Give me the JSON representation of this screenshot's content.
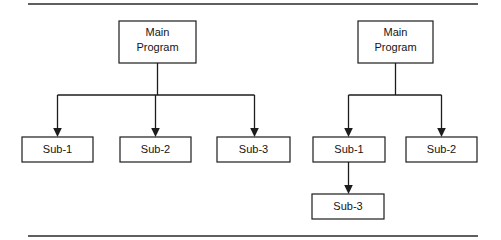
{
  "page": {
    "background_color": "#ffffff",
    "line_color": "#1c1c1c",
    "text_color": "#141414",
    "width": 501,
    "height": 240
  },
  "rules": [
    {
      "name": "top-rule",
      "x1": 28,
      "y1": 4,
      "x2": 478,
      "y2": 4
    },
    {
      "name": "bottom-rule",
      "x1": 28,
      "y1": 236,
      "x2": 478,
      "y2": 236
    }
  ],
  "diagram": {
    "type": "tree",
    "groups": [
      {
        "id": "left-structure-chart",
        "root": {
          "id": "left-main",
          "label_line1": "Main",
          "label_line2": "Program",
          "x": 119,
          "y": 21,
          "w": 77,
          "h": 42
        },
        "children": [
          {
            "id": "left-sub-1",
            "label_line1": "Sub-1",
            "label_line2": "",
            "x": 22,
            "y": 137,
            "w": 71,
            "h": 25
          },
          {
            "id": "left-sub-2",
            "label_line1": "Sub-2",
            "label_line2": "",
            "x": 120,
            "y": 137,
            "w": 71,
            "h": 25
          },
          {
            "id": "left-sub-3",
            "label_line1": "Sub-3",
            "label_line2": "",
            "x": 217,
            "y": 137,
            "w": 73,
            "h": 25
          }
        ],
        "bus": {
          "y": 95,
          "x_left": 57,
          "x_right": 254,
          "stem_x": 157,
          "stem_y_top": 63
        }
      },
      {
        "id": "right-structure-chart",
        "root": {
          "id": "right-main",
          "label_line1": "Main",
          "label_line2": "Program",
          "x": 358,
          "y": 21,
          "w": 75,
          "h": 42
        },
        "children": [
          {
            "id": "right-sub-1",
            "label_line1": "Sub-1",
            "label_line2": "",
            "x": 313,
            "y": 137,
            "w": 72,
            "h": 25
          },
          {
            "id": "right-sub-2",
            "label_line1": "Sub-2",
            "label_line2": "",
            "x": 406,
            "y": 137,
            "w": 71,
            "h": 25
          }
        ],
        "bus": {
          "y": 95,
          "x_left": 348,
          "x_right": 442,
          "stem_x": 395,
          "stem_y_top": 63
        },
        "nested": [
          {
            "id": "right-sub-3",
            "label_line1": "Sub-3",
            "label_line2": "",
            "x": 312,
            "y": 194,
            "w": 72,
            "h": 25,
            "parent": "right-sub-1",
            "link": {
              "x": 349,
              "y_top": 162,
              "y_bottom": 194
            }
          }
        ]
      }
    ]
  }
}
